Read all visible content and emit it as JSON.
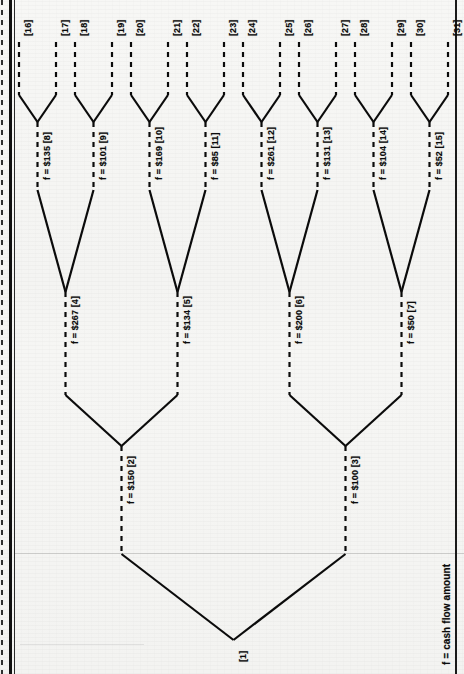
{
  "figure": {
    "type": "binary-cash-flow-tree",
    "orientation": "rotated-90-ccw",
    "legend": "f = cash flow amount",
    "root": {
      "id": "[1]",
      "label": "[1]"
    },
    "nodes": [
      {
        "id": "[2]",
        "amount": "$150",
        "label": "f = $150 [2]",
        "level": 1
      },
      {
        "id": "[3]",
        "amount": "$100",
        "label": "f = $100 [3]",
        "level": 1
      },
      {
        "id": "[4]",
        "amount": "$267",
        "label": "f = $267 [4]",
        "level": 2
      },
      {
        "id": "[5]",
        "amount": "$134",
        "label": "f = $134 [5]",
        "level": 2
      },
      {
        "id": "[6]",
        "amount": "$200",
        "label": "f = $200 [6]",
        "level": 2
      },
      {
        "id": "[7]",
        "amount": "$50",
        "label": "f = $50 [7]",
        "level": 2
      },
      {
        "id": "[8]",
        "amount": "$135",
        "label": "f = $135 [8]",
        "level": 3
      },
      {
        "id": "[9]",
        "amount": "$101",
        "label": "f = $101 [9]",
        "level": 3
      },
      {
        "id": "[10]",
        "amount": "$169",
        "label": "f = $169 [10]",
        "level": 3
      },
      {
        "id": "[11]",
        "amount": "$85",
        "label": "f = $85  [11]",
        "level": 3
      },
      {
        "id": "[12]",
        "amount": "$261",
        "label": "f = $261 [12]",
        "level": 3
      },
      {
        "id": "[13]",
        "amount": "$131",
        "label": "f = $131 [13]",
        "level": 3
      },
      {
        "id": "[14]",
        "amount": "$104",
        "label": "f = $104 [14]",
        "level": 3
      },
      {
        "id": "[15]",
        "amount": "$52",
        "label": "f = $52  [15]",
        "level": 3
      }
    ],
    "leaves": [
      {
        "id": "[16]",
        "label": "[16]"
      },
      {
        "id": "[17]",
        "label": "[17]"
      },
      {
        "id": "[18]",
        "label": "[18]"
      },
      {
        "id": "[19]",
        "label": "[19]"
      },
      {
        "id": "[20]",
        "label": "[20]"
      },
      {
        "id": "[21]",
        "label": "[21]"
      },
      {
        "id": "[22]",
        "label": "[22]"
      },
      {
        "id": "[23]",
        "label": "[23]"
      },
      {
        "id": "[24]",
        "label": "[24]"
      },
      {
        "id": "[25]",
        "label": "[25]"
      },
      {
        "id": "[26]",
        "label": "[26]"
      },
      {
        "id": "[27]",
        "label": "[27]"
      },
      {
        "id": "[28]",
        "label": "[28]"
      },
      {
        "id": "[29]",
        "label": "[29]"
      },
      {
        "id": "[30]",
        "label": "[30]"
      },
      {
        "id": "[31]",
        "label": "[31]"
      }
    ],
    "edges": [
      {
        "from": "[1]",
        "to": "[2]"
      },
      {
        "from": "[1]",
        "to": "[3]"
      },
      {
        "from": "[2]",
        "to": "[4]"
      },
      {
        "from": "[2]",
        "to": "[5]"
      },
      {
        "from": "[3]",
        "to": "[6]"
      },
      {
        "from": "[3]",
        "to": "[7]"
      },
      {
        "from": "[4]",
        "to": "[8]"
      },
      {
        "from": "[4]",
        "to": "[9]"
      },
      {
        "from": "[5]",
        "to": "[10]"
      },
      {
        "from": "[5]",
        "to": "[11]"
      },
      {
        "from": "[6]",
        "to": "[12]"
      },
      {
        "from": "[6]",
        "to": "[13]"
      },
      {
        "from": "[7]",
        "to": "[14]"
      },
      {
        "from": "[7]",
        "to": "[15]"
      },
      {
        "from": "[8]",
        "to": "[16]"
      },
      {
        "from": "[8]",
        "to": "[17]"
      },
      {
        "from": "[9]",
        "to": "[18]"
      },
      {
        "from": "[9]",
        "to": "[19]"
      },
      {
        "from": "[10]",
        "to": "[20]"
      },
      {
        "from": "[10]",
        "to": "[21]"
      },
      {
        "from": "[11]",
        "to": "[22]"
      },
      {
        "from": "[11]",
        "to": "[23]"
      },
      {
        "from": "[12]",
        "to": "[24]"
      },
      {
        "from": "[12]",
        "to": "[25]"
      },
      {
        "from": "[13]",
        "to": "[26]"
      },
      {
        "from": "[13]",
        "to": "[27]"
      },
      {
        "from": "[14]",
        "to": "[28]"
      },
      {
        "from": "[14]",
        "to": "[29]"
      },
      {
        "from": "[15]",
        "to": "[30]"
      },
      {
        "from": "[15]",
        "to": "[31]"
      }
    ],
    "colors": {
      "ink": "#0b0b0b",
      "paper": "#f5f5f3",
      "rule": "#8a8a8a"
    }
  }
}
